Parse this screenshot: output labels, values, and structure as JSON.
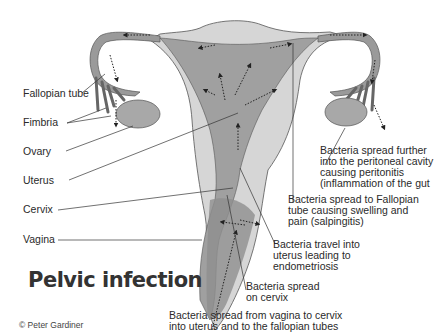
{
  "title": "Pelvic infection",
  "credit": "© Peter Gardiner",
  "anatomy_labels": [
    {
      "id": "fallopian-tube",
      "text": "Fallopian tube"
    },
    {
      "id": "fimbria",
      "text": "Fimbria"
    },
    {
      "id": "ovary",
      "text": "Ovary"
    },
    {
      "id": "uterus",
      "text": "Uterus"
    },
    {
      "id": "cervix",
      "text": "Cervix"
    },
    {
      "id": "vagina",
      "text": "Vagina"
    }
  ],
  "annotations": [
    {
      "id": "peritoneal",
      "text": "Bacteria spread further\ninto the peritoneal cavity\ncausing peritonitis\n(inflammation of the gut"
    },
    {
      "id": "salpingitis",
      "text": "Bacteria spread to Fallopian\ntube causing swelling and\npain (salpingitis)"
    },
    {
      "id": "endometriosis",
      "text": "Bacteria travel into\nuterus leading to\nendometriosis"
    },
    {
      "id": "cervix-spread",
      "text": "Bacteria spread\non cervix"
    },
    {
      "id": "vagina-spread",
      "text": "Bacteria spread from vagina to cervix\ninto uterus and to the fallopian tubes"
    }
  ],
  "colors": {
    "outer_tissue": "#d4d4d4",
    "inner_tissue": "#9e9e9e",
    "ovary": "#a8a8a8",
    "line": "#333333",
    "text": "#2a2a2a"
  }
}
